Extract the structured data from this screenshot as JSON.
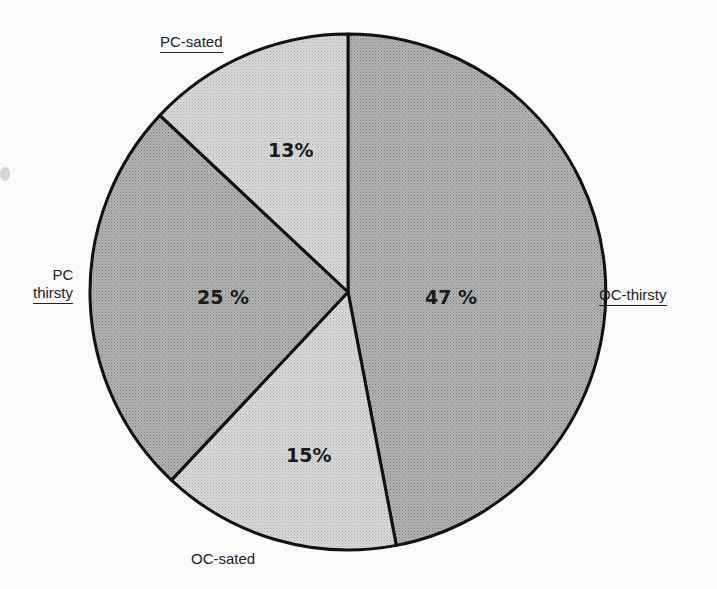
{
  "chart_data": {
    "type": "pie",
    "title": "",
    "slices": [
      {
        "label": "OC-thirsty",
        "value": 47,
        "display": "47 %",
        "color": "#a9a9a9"
      },
      {
        "label": "OC-sated",
        "value": 15,
        "display": "15%",
        "color": "#d3d3d3"
      },
      {
        "label": "PC thirsty",
        "value": 25,
        "display": "25 %",
        "color": "#b0b0b0"
      },
      {
        "label": "PC-sated",
        "value": 13,
        "display": "13%",
        "color": "#dcdcdc"
      }
    ],
    "start_angle_deg": 0,
    "direction": "clockwise",
    "legend": "none (labels placed outside slices)"
  },
  "labels": {
    "oc_thirsty": "OC-thirsty",
    "oc_sated": "OC-sated",
    "pc_thirsty_line1": "PC",
    "pc_thirsty_line2": "thirsty",
    "pc_sated": "PC-sated"
  },
  "percents": {
    "oc_thirsty": "47 %",
    "oc_sated": "15%",
    "pc_thirsty": "25 %",
    "pc_sated": "13%"
  }
}
